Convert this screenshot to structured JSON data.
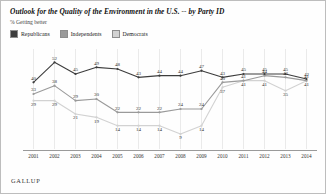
{
  "header": {
    "title": "Outlook for the Quality of the Environment in the U.S. -- by Party ID",
    "subtitle": "% Getting better"
  },
  "source": {
    "label": "GALLUP"
  },
  "legend": {
    "items": [
      {
        "label": "Republicans",
        "color": "#3d3d3d"
      },
      {
        "label": "Independents",
        "color": "#9a9a9a"
      },
      {
        "label": "Democrats",
        "color": "#d2d2d2"
      }
    ]
  },
  "chart_data": {
    "type": "line",
    "title": "Outlook for the Quality of the Environment in the U.S. -- by Party ID",
    "subtitle": "% Getting better",
    "xlabel": "",
    "ylabel": "% Getting better",
    "ylim": [
      0,
      60
    ],
    "grid": true,
    "legend_position": "top-left",
    "categories": [
      "2001",
      "2002",
      "2003",
      "2004",
      "2005",
      "2006",
      "2007",
      "2008",
      "2009",
      "2010",
      "2011",
      "2012",
      "2013",
      "2014"
    ],
    "series": [
      {
        "name": "Republicans",
        "color": "#3d3d3d",
        "values": [
          40,
          52,
          45,
          49,
          48,
          43,
          44,
          44,
          47,
          43,
          45,
          45,
          45,
          42
        ]
      },
      {
        "name": "Independents",
        "color": "#9a9a9a",
        "values": [
          33,
          38,
          29,
          30,
          22,
          22,
          22,
          24,
          24,
          40,
          41,
          44,
          43,
          41
        ]
      },
      {
        "name": "Democrats",
        "color": "#d2d2d2",
        "values": [
          29,
          29,
          21,
          19,
          14,
          14,
          14,
          9,
          14,
          37,
          41,
          41,
          35,
          41
        ]
      }
    ]
  }
}
